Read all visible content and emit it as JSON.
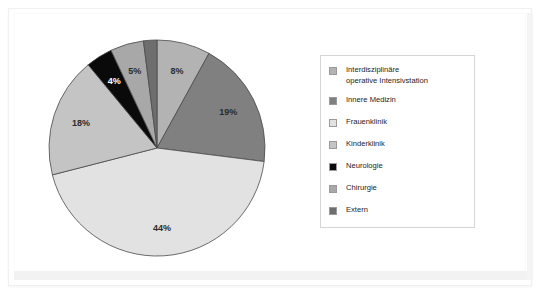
{
  "chart_data": {
    "type": "pie",
    "title": "",
    "labels": [
      "Interdisziplinäre operative Intensivstation",
      "Innere Medizin",
      "Frauenklinik",
      "Kinderklinik",
      "Neurologie",
      "Chirurgie",
      "Extern"
    ],
    "values": [
      8,
      19,
      44,
      18,
      4,
      5,
      2
    ],
    "value_labels": [
      "8%",
      "19%",
      "44%",
      "18%",
      "4%",
      "5%",
      "2%"
    ],
    "colors": [
      "#b3b3b3",
      "#808080",
      "#e2e2e2",
      "#c4c4c4",
      "#0a0a0a",
      "#a8a8a8",
      "#6e6e6e"
    ],
    "label_text_colors": [
      "#2b2b2b",
      "#2b2b2b",
      "#2b2b2b",
      "#2b2b2b",
      "#ffffff",
      "#2b2b2b",
      "#2b2b2b"
    ],
    "start_angle_deg": 0,
    "direction": "clockwise",
    "legend_position": "right",
    "grid": false,
    "units": "percent"
  },
  "legend": {
    "items": [
      {
        "label": "Interdisziplinäre\noperative Intensivstation",
        "color": "#b3b3b3"
      },
      {
        "label": "Innere Medizin",
        "color": "#808080"
      },
      {
        "label": "Frauenklinik",
        "color": "#e2e2e2"
      },
      {
        "label": "Kinderklinik",
        "color": "#c4c4c4"
      },
      {
        "label": "Neurologie",
        "color": "#0a0a0a"
      },
      {
        "label": "Chirurgie",
        "color": "#a8a8a8"
      },
      {
        "label": "Extern",
        "color": "#6e6e6e"
      }
    ]
  },
  "pie_labels": {
    "s0": "8%",
    "s1": "19%",
    "s2": "44%",
    "s3": "18%",
    "s4": "4%",
    "s5": "5%",
    "s6": "2%"
  }
}
